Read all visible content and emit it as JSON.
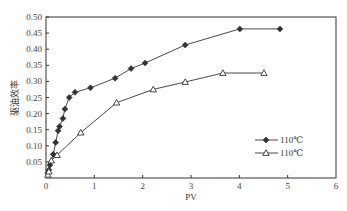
{
  "chart_data": {
    "type": "line",
    "title": "",
    "xlabel": "PV",
    "ylabel": "驱油效率",
    "xlim": [
      0,
      6
    ],
    "ylim": [
      0,
      0.5
    ],
    "xticks": [
      "0",
      "1",
      "2",
      "3",
      "4",
      "5",
      "6"
    ],
    "yticks": [
      "0.05",
      "0.10",
      "0.15",
      "0.20",
      "0.25",
      "0.30",
      "0.35",
      "0.40",
      "0.45",
      "0.50"
    ],
    "grid": false,
    "legend_position": "lower right",
    "series": [
      {
        "name": "110℃",
        "marker": "filled-diamond",
        "color": "#333333",
        "x": [
          0.04,
          0.06,
          0.08,
          0.15,
          0.2,
          0.25,
          0.28,
          0.35,
          0.39,
          0.48,
          0.6,
          0.92,
          1.43,
          1.76,
          2.05,
          2.88,
          4.01,
          4.84
        ],
        "y": [
          0.016,
          0.025,
          0.04,
          0.074,
          0.11,
          0.147,
          0.16,
          0.185,
          0.214,
          0.25,
          0.266,
          0.28,
          0.31,
          0.34,
          0.357,
          0.413,
          0.463,
          0.463
        ]
      },
      {
        "name": "110℃",
        "marker": "open-triangle",
        "color": "#333333",
        "x": [
          0.04,
          0.06,
          0.11,
          0.23,
          0.72,
          1.46,
          2.22,
          2.88,
          3.66,
          4.51
        ],
        "y": [
          0.01,
          0.02,
          0.054,
          0.071,
          0.141,
          0.234,
          0.275,
          0.298,
          0.326,
          0.326
        ]
      }
    ]
  }
}
